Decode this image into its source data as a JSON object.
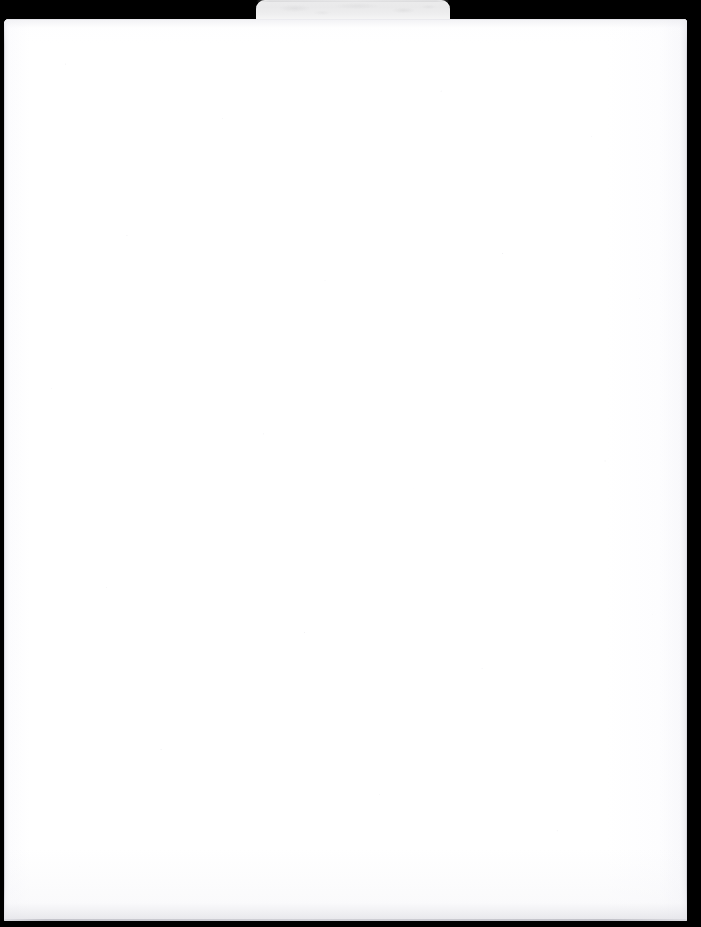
{
  "document": {
    "page_type": "blank-scanned-page",
    "page_body_text": "",
    "tab": {
      "label": "",
      "color": "#e9e9ea"
    },
    "colors": {
      "background": "#000000",
      "paper": "#fefeff",
      "tab": "#e9e9ea",
      "edge_line": "#cdcdd4"
    }
  }
}
